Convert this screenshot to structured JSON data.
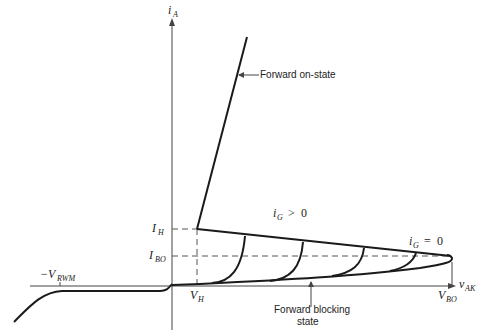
{
  "diagram": {
    "axes": {
      "y_label": {
        "main": "i",
        "sub": "A"
      },
      "x_label": {
        "main": "v",
        "sub": "AK"
      }
    },
    "labels": {
      "forward_on_state": "Forward on-state",
      "forward_blocking_line1": "Forward blocking",
      "forward_blocking_line2": "state",
      "ig_positive": {
        "main": "i",
        "sub": "G",
        "rel": ">",
        "val": "0"
      },
      "ig_zero": {
        "main": "i",
        "sub": "G",
        "rel": "=",
        "val": "0"
      },
      "i_h": {
        "main": "I",
        "sub": "H"
      },
      "i_bo": {
        "main": "I",
        "sub": "BO"
      },
      "v_h": {
        "main": "V",
        "sub": "H"
      },
      "v_bo": {
        "main": "V",
        "sub": "BO"
      },
      "v_rwm": {
        "prefix": "−V",
        "sub": "RWM"
      }
    },
    "colors": {
      "line": "#1a1a1a",
      "dashed": "#555555",
      "axis": "#444444"
    }
  }
}
